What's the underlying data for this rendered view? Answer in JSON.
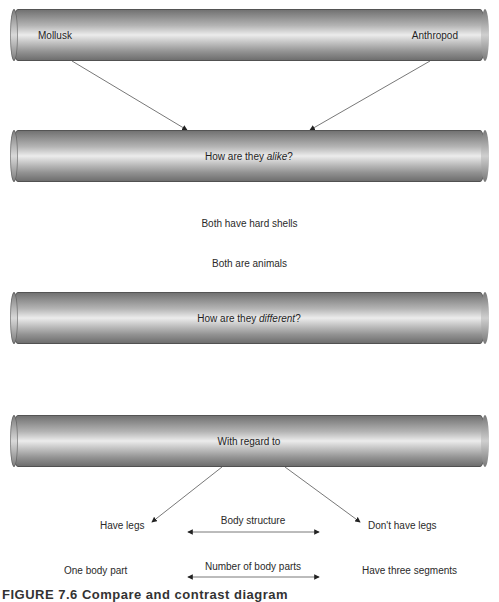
{
  "top_cylinder": {
    "left_label": "Mollusk",
    "right_label": "Anthropod"
  },
  "alike_cylinder": {
    "prefix": "How are they ",
    "emphasis": "alike",
    "suffix": "?"
  },
  "similarities": [
    "Both have hard shells",
    "Both are animals"
  ],
  "different_cylinder": {
    "prefix": "How are they ",
    "emphasis": "different",
    "suffix": "?"
  },
  "regard_cylinder": {
    "label": "With regard to"
  },
  "differences": [
    {
      "left": "Have legs",
      "criterion": "Body structure",
      "right": "Don't have legs"
    },
    {
      "left": "One body part",
      "criterion": "Number of body parts",
      "right": "Have three segments"
    }
  ],
  "caption": {
    "text": "FIGURE 7.6   Compare and contrast diagram"
  },
  "colors": {
    "line": "#555555",
    "text": "#2a2a2a",
    "cylinder_dark": "#6a6a6a",
    "cylinder_light": "#ececec"
  }
}
